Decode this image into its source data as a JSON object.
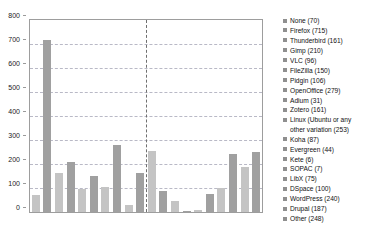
{
  "chart_data": {
    "type": "bar",
    "title": "",
    "xlabel": "",
    "ylabel": "",
    "ylim": [
      0,
      800
    ],
    "yticks": [
      0,
      100,
      200,
      300,
      400,
      500,
      600,
      700,
      800
    ],
    "grid": true,
    "legend_position": "right",
    "categories": [
      "None",
      "Firefox",
      "Thunderbird",
      "Gimp",
      "VLC",
      "FileZilla",
      "Pidgin",
      "OpenOffice",
      "Adium",
      "Zotero",
      "Linux (Ubuntu or any other variation)",
      "Koha",
      "Evergreen",
      "Kete",
      "SOPAC",
      "LibX",
      "DSpace",
      "WordPress",
      "Drupal",
      "Other"
    ],
    "values": [
      70,
      715,
      161,
      210,
      96,
      150,
      106,
      279,
      31,
      161,
      253,
      87,
      44,
      6,
      7,
      75,
      100,
      240,
      187,
      248
    ],
    "annotations": {
      "divider_after_category_index": 9,
      "divider_style": "dashed vertical line"
    },
    "colors": {
      "bar_light": "#c4c4c4",
      "bar_dark": "#a0a0a0",
      "gridline": "#b9b9c6",
      "frame": "#9d9d9d",
      "divider": "#6f6f6f",
      "legend_swatch": "#8f8f8f",
      "text": "#1a1a1a",
      "background": "#ffffff"
    }
  },
  "legend": {
    "entries": [
      {
        "label": "None (70)"
      },
      {
        "label": "Firefox (715)"
      },
      {
        "label": "Thunderbird (161)"
      },
      {
        "label": "Gimp (210)"
      },
      {
        "label": "VLC (96)"
      },
      {
        "label": "FileZilla (150)"
      },
      {
        "label": "Pidgin (106)"
      },
      {
        "label": "OpenOffice (279)"
      },
      {
        "label": "Adium (31)"
      },
      {
        "label": "Zotero (161)"
      },
      {
        "label": "Linux (Ubuntu or any\nother variation (253)"
      },
      {
        "label": "Koha (87)"
      },
      {
        "label": "Evergreen (44)"
      },
      {
        "label": "Kete (6)"
      },
      {
        "label": "SOPAC (7)"
      },
      {
        "label": "LibX (75)"
      },
      {
        "label": "DSpace (100)"
      },
      {
        "label": "WordPress (240)"
      },
      {
        "label": "Drupal (187)"
      },
      {
        "label": "Other (248)"
      }
    ]
  },
  "axis": {
    "y_tick_labels": [
      "800",
      "700",
      "600",
      "500",
      "400",
      "300",
      "200",
      "100",
      "0"
    ]
  }
}
